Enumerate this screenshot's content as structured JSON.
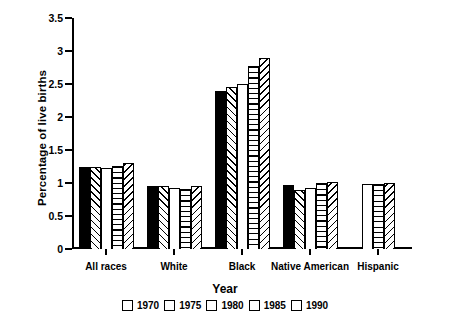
{
  "chart_data": {
    "type": "bar",
    "title": "",
    "xlabel": "Year",
    "ylabel": "Percentage of live births",
    "categories": [
      "All races",
      "White",
      "Black",
      "Native American",
      "Hispanic"
    ],
    "ylim": [
      0,
      3.5
    ],
    "ytick_labels": [
      "0",
      "0.5",
      "1",
      "1.5",
      "2",
      "2.5",
      "3",
      "3.5"
    ],
    "ytick_values": [
      0,
      0.5,
      1,
      1.5,
      2,
      2.5,
      3,
      3.5
    ],
    "grid": false,
    "legend_position": "bottom",
    "series": [
      {
        "name": "1970",
        "pattern": "solid-black",
        "values": [
          1.25,
          0.95,
          2.4,
          0.97,
          null
        ]
      },
      {
        "name": "1975",
        "pattern": "diagonal-forward",
        "values": [
          1.24,
          0.95,
          2.45,
          0.9,
          null
        ]
      },
      {
        "name": "1980",
        "pattern": "blank-white",
        "values": [
          1.22,
          0.93,
          2.5,
          0.92,
          0.98
        ]
      },
      {
        "name": "1985",
        "pattern": "horizontal-lines",
        "values": [
          1.26,
          0.91,
          2.78,
          1.0,
          0.99
        ]
      },
      {
        "name": "1990",
        "pattern": "diagonal-backward",
        "values": [
          1.31,
          0.95,
          2.9,
          1.01,
          1.0
        ]
      }
    ]
  },
  "legend": {
    "entries": [
      {
        "label": "1970"
      },
      {
        "label": "1975"
      },
      {
        "label": "1980"
      },
      {
        "label": "1985"
      },
      {
        "label": "1990"
      }
    ]
  }
}
